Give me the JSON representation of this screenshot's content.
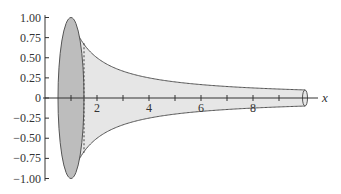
{
  "figure": {
    "x_axis_label": "x",
    "x_ticks": [
      {
        "value": 1,
        "label": ""
      },
      {
        "value": 2,
        "label": "2"
      },
      {
        "value": 3,
        "label": ""
      },
      {
        "value": 4,
        "label": "4"
      },
      {
        "value": 5,
        "label": ""
      },
      {
        "value": 6,
        "label": "6"
      },
      {
        "value": 7,
        "label": ""
      },
      {
        "value": 8,
        "label": "8"
      },
      {
        "value": 9,
        "label": ""
      }
    ],
    "y_ticks": [
      {
        "value": 1.0,
        "label": "1.00"
      },
      {
        "value": 0.75,
        "label": "0.75"
      },
      {
        "value": 0.5,
        "label": "0.50"
      },
      {
        "value": 0.25,
        "label": "0.25"
      },
      {
        "value": 0,
        "label": "0"
      },
      {
        "value": -0.25,
        "label": "−0.25"
      },
      {
        "value": -0.5,
        "label": "−0.50"
      },
      {
        "value": -0.75,
        "label": "−0.75"
      },
      {
        "value": -1.0,
        "label": "−1.00"
      }
    ],
    "curve": "y = 1/x",
    "x_start": 1,
    "x_end": 10,
    "colors": {
      "horn_fill": "#e6e6e6",
      "disk_fill": "#bdbdbd",
      "outline": "#555555"
    }
  }
}
